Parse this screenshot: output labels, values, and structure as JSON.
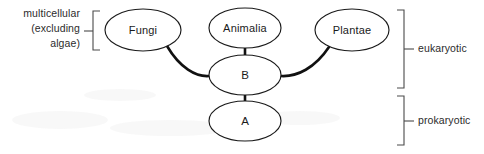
{
  "diagram": {
    "background_color": "#ffffff",
    "stroke_color": "#111111",
    "bracket_color": "#4a4a4a",
    "text_color": "#1a1a1a",
    "nodes": [
      {
        "id": "fungi",
        "label": "Fungi",
        "cx": 143,
        "cy": 30,
        "rx": 38,
        "ry": 21
      },
      {
        "id": "animalia",
        "label": "Animalia",
        "cx": 245,
        "cy": 28,
        "rx": 36,
        "ry": 20
      },
      {
        "id": "plantae",
        "label": "Plantae",
        "cx": 352,
        "cy": 30,
        "rx": 37,
        "ry": 21
      },
      {
        "id": "b",
        "label": "B",
        "cx": 245,
        "cy": 75,
        "rx": 36,
        "ry": 20
      },
      {
        "id": "a",
        "label": "A",
        "cx": 245,
        "cy": 121,
        "rx": 36,
        "ry": 20
      }
    ],
    "connectors": [
      {
        "id": "fungi-to-b",
        "from": "fungi",
        "to": "b",
        "style": "curve"
      },
      {
        "id": "animalia-to-b",
        "from": "animalia",
        "to": "b",
        "style": "straight"
      },
      {
        "id": "plantae-to-b",
        "from": "plantae",
        "to": "b",
        "style": "curve"
      },
      {
        "id": "b-to-a",
        "from": "b",
        "to": "a",
        "style": "straight"
      }
    ],
    "left_bracket": {
      "id": "multicellular-bracket",
      "label_lines": [
        "multicellular",
        "(excluding",
        "algae)"
      ],
      "label_text": "multicellular (excluding algae)",
      "side": "left",
      "top": 10,
      "bottom": 50,
      "x": 93
    },
    "right_brackets": [
      {
        "id": "eukaryotic-bracket",
        "label": "eukaryotic",
        "side": "right",
        "top": 10,
        "bottom": 88,
        "x": 404
      },
      {
        "id": "prokaryotic-bracket",
        "label": "prokaryotic",
        "side": "right",
        "top": 96,
        "bottom": 145,
        "x": 404
      }
    ]
  }
}
